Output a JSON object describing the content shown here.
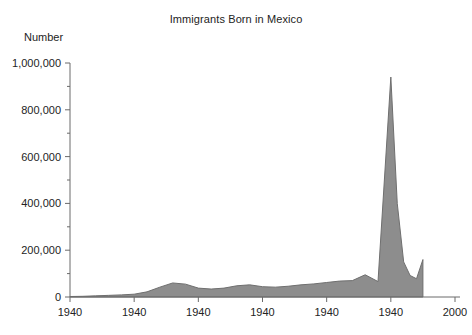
{
  "chart_data": {
    "type": "area",
    "title": "Immigrants Born in Mexico",
    "ylabel": "Number",
    "xlabel": "",
    "grid": false,
    "legend": null,
    "ylim": [
      0,
      1000000
    ],
    "xlim": [
      1940,
      2000
    ],
    "y_ticks_major": [
      0,
      200000,
      400000,
      600000,
      800000,
      1000000
    ],
    "y_tick_labels": [
      "0",
      "200,000",
      "400,000",
      "600,000",
      "800,000",
      "1,000,000"
    ],
    "y_ticks_minor": [
      100000,
      300000,
      500000,
      700000,
      900000
    ],
    "x_ticks": [
      1940,
      1950,
      1960,
      1970,
      1980,
      1990,
      2000
    ],
    "x_tick_labels": [
      "1940",
      "1940",
      "1940",
      "1940",
      "1940",
      "1940",
      "2000"
    ],
    "series_name": "Immigrants Born in Mexico",
    "fill_color": "#8d8d8d",
    "line_color": "#6f6f6f",
    "axis_color": "#6a6a6a",
    "x": [
      1940,
      1942,
      1944,
      1946,
      1948,
      1950,
      1952,
      1954,
      1956,
      1958,
      1960,
      1962,
      1964,
      1966,
      1968,
      1970,
      1972,
      1974,
      1976,
      1978,
      1980,
      1982,
      1984,
      1986,
      1988,
      1990,
      1991,
      1992,
      1993,
      1994,
      1995
    ],
    "values": [
      2000,
      3000,
      5000,
      7000,
      9000,
      12000,
      22000,
      42000,
      60000,
      55000,
      38000,
      34000,
      38000,
      48000,
      52000,
      44000,
      42000,
      46000,
      52000,
      56000,
      62000,
      68000,
      70000,
      95000,
      66000,
      940000,
      400000,
      150000,
      92000,
      78000,
      160000
    ],
    "peak": {
      "year": 1990,
      "value": 940000
    },
    "end_value": 150000
  }
}
